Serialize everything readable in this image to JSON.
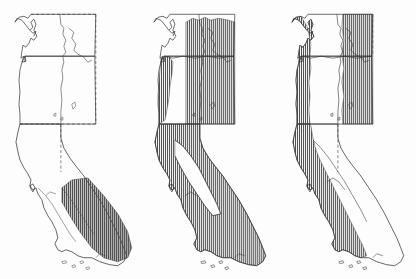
{
  "figure": {
    "type": "multi-panel-distribution-map",
    "panel_count": 3,
    "region": "Pacific Northwest and California, western United States",
    "states_depicted": [
      "Washington",
      "Oregon",
      "Idaho",
      "Nevada",
      "California"
    ],
    "background_color": "#fdfdfd",
    "outline_color": "#333333",
    "hatch_color": "#4a4a4a",
    "hatch_orientation": "vertical",
    "hatch_spacing_px": 2,
    "dashed_border_note": "dashed lines mark the study-area box boundary and international border"
  },
  "panels": [
    {
      "id": "panel-1",
      "label": "",
      "shaded_description": "southeastern California desert region only",
      "shaded_regions": [
        "Mojave Desert",
        "Sonoran Desert",
        "southern Sierra Nevada east slope"
      ],
      "unshaded_regions": [
        "Washington",
        "Oregon",
        "Idaho",
        "northern California",
        "coastal California"
      ],
      "shaded_fraction": 0.12
    },
    {
      "id": "panel-2",
      "label": "",
      "shaded_description": "eastern Washington, Idaho, eastern Oregon, Oregon coast, and nearly all of California except the Central Valley",
      "shaded_regions": [
        "eastern Washington",
        "Idaho",
        "eastern Oregon",
        "Oregon Coast Range",
        "Klamath",
        "Sierra Nevada",
        "southern California",
        "Mojave Desert",
        "Nevada margin"
      ],
      "unshaded_regions": [
        "Puget Sound lowland",
        "western Washington",
        "Willamette Valley",
        "California Central Valley"
      ],
      "shaded_fraction": 0.62
    },
    {
      "id": "panel-3",
      "label": "",
      "shaded_description": "western coastal band plus eastern uplands, leaving an unshaded interior lowland corridor",
      "shaded_regions": [
        "Washington coast",
        "Cascades",
        "eastern Washington",
        "Idaho",
        "Oregon Coast Range",
        "eastern Oregon",
        "California Coast Ranges",
        "western Sierra Nevada"
      ],
      "unshaded_regions": [
        "Puget Sound lowland",
        "Willamette Valley",
        "California Central Valley",
        "southeastern California desert",
        "Nevada interior"
      ],
      "shaded_fraction": 0.45
    }
  ],
  "geography_labels": {
    "washington": "Washington",
    "oregon": "Oregon",
    "idaho": "Idaho",
    "nevada": "Nevada",
    "california": "California",
    "puget_sound": "Puget Sound",
    "channel_islands": "Channel Islands",
    "san_francisco_bay": "San Francisco Bay"
  }
}
